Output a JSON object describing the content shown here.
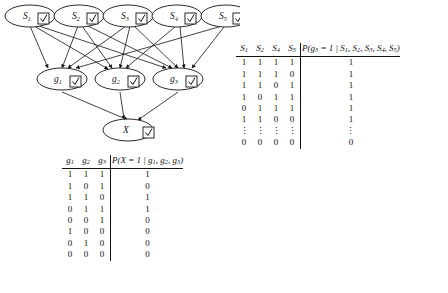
{
  "figure": {
    "type": "bayesian-network-with-cpt",
    "graph": {
      "layers": [
        {
          "name": "source-layer",
          "nodes": [
            {
              "id": "S1",
              "label": "S",
              "sub": "1",
              "observed": true
            },
            {
              "id": "S2",
              "label": "S",
              "sub": "2",
              "observed": true
            },
            {
              "id": "S3",
              "label": "S",
              "sub": "3",
              "observed": true
            },
            {
              "id": "S4",
              "label": "S",
              "sub": "4",
              "observed": true
            },
            {
              "id": "S5",
              "label": "S",
              "sub": "5",
              "observed": true
            }
          ]
        },
        {
          "name": "gene-layer",
          "nodes": [
            {
              "id": "g1",
              "label": "g",
              "sub": "1",
              "observed": true
            },
            {
              "id": "g2",
              "label": "g",
              "sub": "2",
              "observed": true
            },
            {
              "id": "g3",
              "label": "g",
              "sub": "3",
              "observed": true
            }
          ]
        },
        {
          "name": "output-layer",
          "nodes": [
            {
              "id": "X",
              "label": "X",
              "sub": "",
              "observed": true
            }
          ]
        }
      ],
      "edges": [
        [
          "S1",
          "g1"
        ],
        [
          "S1",
          "g2"
        ],
        [
          "S1",
          "g3"
        ],
        [
          "S2",
          "g1"
        ],
        [
          "S2",
          "g2"
        ],
        [
          "S2",
          "g3"
        ],
        [
          "S3",
          "g1"
        ],
        [
          "S3",
          "g2"
        ],
        [
          "S3",
          "g3"
        ],
        [
          "S4",
          "g2"
        ],
        [
          "S4",
          "g3"
        ],
        [
          "S5",
          "g1"
        ],
        [
          "S5",
          "g3"
        ],
        [
          "g1",
          "X"
        ],
        [
          "g2",
          "X"
        ],
        [
          "g3",
          "X"
        ]
      ],
      "checkbox_glyph": "check-mark"
    },
    "tables": [
      {
        "id": "cpt-g3",
        "position": "top-right",
        "bit_headers": [
          {
            "label": "S",
            "sub": "1"
          },
          {
            "label": "S",
            "sub": "2"
          },
          {
            "label": "S",
            "sub": "4"
          },
          {
            "label": "S",
            "sub": "5"
          }
        ],
        "prob_header": {
          "prefix": "P(",
          "var": "g",
          "var_sub": "3",
          "text": " = 1 | ",
          "parents": [
            "S1",
            "S2",
            "S3",
            "S4",
            "S5"
          ],
          "full": "P(g3 = 1 | S1, S2, S3, S4, S5)"
        },
        "rows": [
          {
            "bits": [
              "1",
              "1",
              "1",
              "1"
            ],
            "p": "1"
          },
          {
            "bits": [
              "1",
              "1",
              "1",
              "0"
            ],
            "p": "1"
          },
          {
            "bits": [
              "1",
              "1",
              "0",
              "1"
            ],
            "p": "1"
          },
          {
            "bits": [
              "1",
              "0",
              "1",
              "1"
            ],
            "p": "1"
          },
          {
            "bits": [
              "0",
              "1",
              "1",
              "1"
            ],
            "p": "1"
          },
          {
            "bits": [
              "1",
              "1",
              "0",
              "0"
            ],
            "p": "1"
          },
          {
            "bits": [
              "⋮",
              "⋮",
              "⋮",
              "⋮"
            ],
            "p": "⋮"
          },
          {
            "bits": [
              "0",
              "0",
              "0",
              "0"
            ],
            "p": "0"
          }
        ]
      },
      {
        "id": "cpt-X",
        "position": "bottom-left",
        "bit_headers": [
          {
            "label": "g",
            "sub": "1"
          },
          {
            "label": "g",
            "sub": "2"
          },
          {
            "label": "g",
            "sub": "3"
          }
        ],
        "prob_header": {
          "prefix": "P(",
          "var": "X",
          "var_sub": "",
          "text": " = 1 | ",
          "parents": [
            "g1",
            "g2",
            "g3"
          ],
          "full": "P(X = 1 | g1, g2, g3)"
        },
        "rows": [
          {
            "bits": [
              "1",
              "1",
              "1"
            ],
            "p": "1"
          },
          {
            "bits": [
              "1",
              "0",
              "1"
            ],
            "p": "0"
          },
          {
            "bits": [
              "1",
              "1",
              "0"
            ],
            "p": "1"
          },
          {
            "bits": [
              "0",
              "1",
              "1"
            ],
            "p": "1"
          },
          {
            "bits": [
              "0",
              "0",
              "1"
            ],
            "p": "0"
          },
          {
            "bits": [
              "1",
              "0",
              "0"
            ],
            "p": "0"
          },
          {
            "bits": [
              "0",
              "1",
              "0"
            ],
            "p": "0"
          },
          {
            "bits": [
              "0",
              "0",
              "0"
            ],
            "p": "0"
          }
        ]
      }
    ]
  }
}
